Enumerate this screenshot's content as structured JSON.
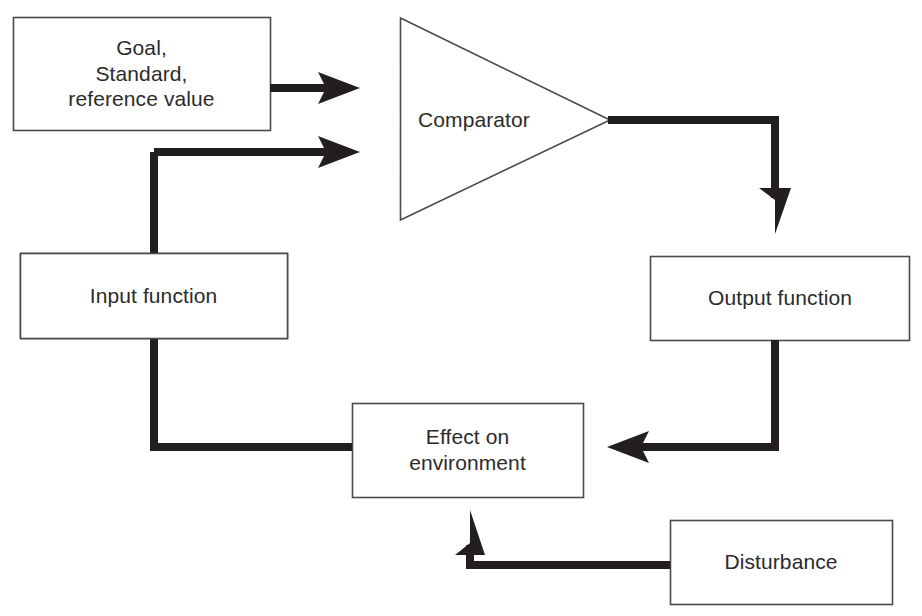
{
  "diagram": {
    "background_color": "#ffffff",
    "box_border_color": "#4a4a4a",
    "box_fill_color": "#ffffff",
    "connector_color": "#231f20",
    "text_color": "#2b2b2b",
    "nodes": {
      "goal": {
        "label": "Goal,\nStandard,\nreference value",
        "shape": "rectangle",
        "x": 13,
        "y": 17,
        "w": 257,
        "h": 113
      },
      "comparator": {
        "label": "Comparator",
        "shape": "triangle-right",
        "x": 400,
        "y": 18,
        "w": 210,
        "h": 202
      },
      "input_function": {
        "label": "Input function",
        "shape": "rectangle",
        "x": 20,
        "y": 253,
        "w": 267,
        "h": 85
      },
      "output_function": {
        "label": "Output function",
        "shape": "rectangle",
        "x": 650,
        "y": 256,
        "w": 260,
        "h": 84
      },
      "effect_on_environment": {
        "label": "Effect on\nenvironment",
        "shape": "rectangle",
        "x": 352,
        "y": 403,
        "w": 231,
        "h": 94
      },
      "disturbance": {
        "label": "Disturbance",
        "shape": "rectangle",
        "x": 670,
        "y": 520,
        "w": 222,
        "h": 84
      }
    },
    "connectors": [
      {
        "name": "goal-to-comparator",
        "from": "goal",
        "to": "comparator",
        "arrowhead": "right"
      },
      {
        "name": "input-function-to-comparator",
        "from": "input_function",
        "to": "comparator",
        "arrowhead": "right"
      },
      {
        "name": "comparator-to-output-function",
        "from": "comparator",
        "to": "output_function",
        "arrowhead": "down"
      },
      {
        "name": "output-function-to-effect",
        "from": "output_function",
        "to": "effect_on_environment",
        "arrowhead": "left"
      },
      {
        "name": "effect-to-input-function",
        "from": "effect_on_environment",
        "to": "input_function",
        "arrowhead": "none"
      },
      {
        "name": "disturbance-to-effect",
        "from": "disturbance",
        "to": "effect_on_environment",
        "arrowhead": "up"
      }
    ]
  }
}
